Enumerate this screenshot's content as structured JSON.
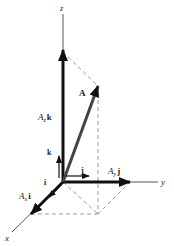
{
  "diagram": {
    "axes": {
      "x": "x",
      "y": "y",
      "z": "z"
    },
    "vector": {
      "label": "A"
    },
    "unit_vectors": {
      "i": "i",
      "j": "j",
      "k": "k"
    },
    "components": {
      "x": {
        "coef": "A",
        "sub": "x",
        "unit": "i"
      },
      "y": {
        "coef": "A",
        "sub": "y",
        "unit": "j"
      },
      "z": {
        "coef": "A",
        "sub": "z",
        "unit": "k"
      }
    },
    "colors": {
      "axis": "#555555",
      "vector": "#333333",
      "component": "#111111",
      "dashed": "#999999"
    }
  }
}
